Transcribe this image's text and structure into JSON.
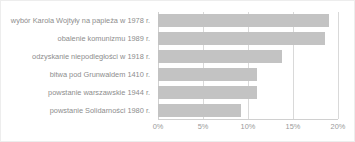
{
  "chart_data": {
    "type": "bar",
    "orientation": "horizontal",
    "title": "",
    "xlabel": "",
    "ylabel": "",
    "xlim": [
      0,
      20
    ],
    "xticks": [
      "0%",
      "5%",
      "10%",
      "15%",
      "20%"
    ],
    "xtick_values": [
      0,
      5,
      10,
      15,
      20
    ],
    "grid": true,
    "legend": false,
    "unit": "%",
    "bar_color": "#c3c3c3",
    "grid_color": "#d9d9d9",
    "text_color": "#8d8d8d",
    "categories": [
      "wybór Karola Wojtyły na papieża w 1978 r.",
      "obalenie komunizmu 1989 r.",
      "odzyskanie niepodległości w 1918 r.",
      "bitwa pod Grunwaldem 1410 r.",
      "powstanie warszawskie 1944 r.",
      "powstanie Solidarności 1980 r."
    ],
    "values": [
      19.0,
      18.5,
      13.8,
      11.0,
      11.0,
      9.2
    ]
  }
}
